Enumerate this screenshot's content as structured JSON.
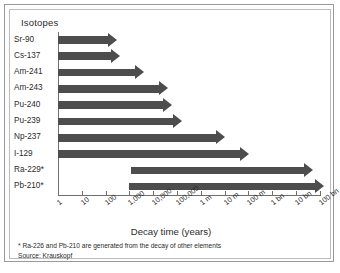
{
  "legend": {
    "title": "Isotopes"
  },
  "axis": {
    "x_title": "Decay time (years)",
    "tick_labels": [
      "1",
      "10",
      "100",
      "1,000",
      "10,000",
      "100,000",
      "1 m",
      "10 m",
      "100 m",
      "1 bn",
      "10 bn",
      "100 bn"
    ]
  },
  "footnotes": {
    "line1": "* Ra-226 and Pb-210 are generated from the decay of other elements",
    "line2": "Source: Krauskopf"
  },
  "colors": {
    "bar": "#4d4d4d",
    "axis": "#6e6e6e",
    "frame_outer": "#9a9a9a",
    "frame_inner": "#bcbcbc",
    "text": "#2b2b2b"
  },
  "chart_data": {
    "type": "bar",
    "orientation": "horizontal",
    "title": "",
    "xlabel": "Decay time (years)",
    "ylabel": "Isotopes",
    "xscale": "log",
    "xlim": [
      1,
      100000000000
    ],
    "grid": false,
    "legend_position": "none",
    "note": "Bars are arrows indicating decay time ranges; Ra-229* and Pb-210* bars begin at about 1,000 years rather than at 1 year.",
    "categories": [
      "Sr-90",
      "Cs-137",
      "Am-241",
      "Am-243",
      "Pu-240",
      "Pu-239",
      "Np-237",
      "I-129",
      "Ra-229*",
      "Pb-210*"
    ],
    "bars": [
      {
        "label": "Sr-90",
        "start": 1,
        "end": 300
      },
      {
        "label": "Cs-137",
        "start": 1,
        "end": 400
      },
      {
        "label": "Am-241",
        "start": 1,
        "end": 4000
      },
      {
        "label": "Am-243",
        "start": 1,
        "end": 40000
      },
      {
        "label": "Pu-240",
        "start": 1,
        "end": 60000
      },
      {
        "label": "Pu-239",
        "start": 1,
        "end": 150000
      },
      {
        "label": "Np-237",
        "start": 1,
        "end": 10000000
      },
      {
        "label": "I-129",
        "start": 1,
        "end": 100000000
      },
      {
        "label": "Ra-229*",
        "start": 1200,
        "end": 50000000000
      },
      {
        "label": "Pb-210*",
        "start": 1000,
        "end": 150000000000
      }
    ]
  }
}
